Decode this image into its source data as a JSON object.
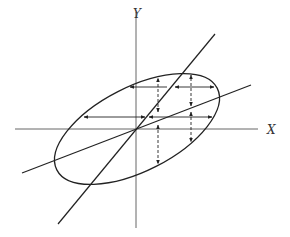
{
  "diagram": {
    "labels": {
      "y_axis": "Y",
      "x_axis": "X"
    },
    "colors": {
      "stroke": "#222222",
      "background": "#ffffff"
    },
    "elements": [
      "x-axis",
      "y-axis",
      "tilted-ellipse",
      "steep-regression-line",
      "shallow-regression-line",
      "horizontal-double-arrows",
      "vertical-dashed-double-arrows"
    ]
  }
}
